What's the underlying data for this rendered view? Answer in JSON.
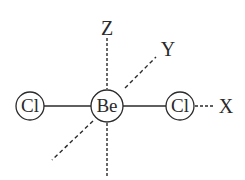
{
  "diagram": {
    "molecule": "BeCl2",
    "atoms": [
      {
        "id": "cl_left",
        "label": "Cl",
        "cx": 30,
        "cy": 106,
        "r": 14
      },
      {
        "id": "be_center",
        "label": "Be",
        "cx": 107,
        "cy": 106,
        "r": 16
      },
      {
        "id": "cl_right",
        "label": "Cl",
        "cx": 180,
        "cy": 106,
        "r": 14
      }
    ],
    "bonds": [
      {
        "from": "cl_left",
        "to": "be_center",
        "style": "solid"
      },
      {
        "from": "be_center",
        "to": "cl_right",
        "style": "solid"
      }
    ],
    "axes": [
      {
        "label": "Z",
        "x": 107,
        "y": 35
      },
      {
        "label": "Y",
        "x": 168,
        "y": 56
      },
      {
        "label": "X",
        "x": 226,
        "y": 113
      }
    ],
    "colors": {
      "line": "#2a2a2a",
      "background": "#ffffff"
    }
  }
}
